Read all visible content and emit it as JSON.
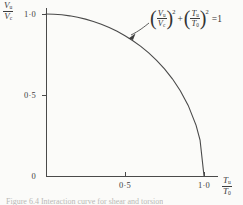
{
  "figure": {
    "background_color": "#fbfbf9",
    "ink_color": "#4a4a4a",
    "caption": "Figure 6.4  Interaction curve for shear and torsion"
  },
  "axes": {
    "x": {
      "label_numerator": "T",
      "label_numerator_sub": "u",
      "label_denominator": "T",
      "label_denominator_sub": "0",
      "ticks": [
        "0",
        "0·5",
        "1·0"
      ],
      "range": [
        0,
        1.15
      ]
    },
    "y": {
      "label_numerator": "V",
      "label_numerator_sub": "u",
      "label_denominator": "V",
      "label_denominator_sub": "c",
      "ticks": [
        "0",
        "0·5",
        "1·0"
      ],
      "range": [
        0,
        1.1
      ]
    }
  },
  "annotation": {
    "term1_numerator": "V",
    "term1_numerator_sub": "u",
    "term1_denominator": "V",
    "term1_denominator_sub": "c",
    "term1_exponent": "2",
    "operator": "+",
    "term2_numerator": "T",
    "term2_numerator_sub": "u",
    "term2_denominator": "T",
    "term2_denominator_sub": "0",
    "term2_exponent": "2",
    "equals": "=",
    "rhs": "1"
  },
  "chart_data": {
    "type": "line",
    "title": "",
    "xlabel": "Tu/T0",
    "ylabel": "Vu/Vc",
    "xlim": [
      0,
      1.15
    ],
    "ylim": [
      0,
      1.1
    ],
    "xticks": [
      0,
      0.5,
      1.0
    ],
    "yticks": [
      0,
      0.5,
      1.0
    ],
    "xticklabels": [
      "0",
      "0·5",
      "1·0"
    ],
    "yticklabels": [
      "0",
      "0·5",
      "1·0"
    ],
    "grid": false,
    "legend": false,
    "equation": "(Vu/Vc)^2 + (Tu/T0)^2 = 1",
    "series": [
      {
        "name": "Interaction curve (unit circle)",
        "x": [
          0.0,
          0.05,
          0.1,
          0.15,
          0.2,
          0.25,
          0.3,
          0.35,
          0.4,
          0.45,
          0.5,
          0.55,
          0.6,
          0.65,
          0.7,
          0.75,
          0.8,
          0.85,
          0.9,
          0.95,
          0.975,
          1.0
        ],
        "y": [
          1.0,
          0.9987,
          0.995,
          0.9887,
          0.9798,
          0.9682,
          0.9539,
          0.9367,
          0.9165,
          0.893,
          0.866,
          0.8352,
          0.8,
          0.7599,
          0.7141,
          0.6614,
          0.6,
          0.5268,
          0.4359,
          0.3122,
          0.2222,
          0.0
        ]
      }
    ]
  }
}
